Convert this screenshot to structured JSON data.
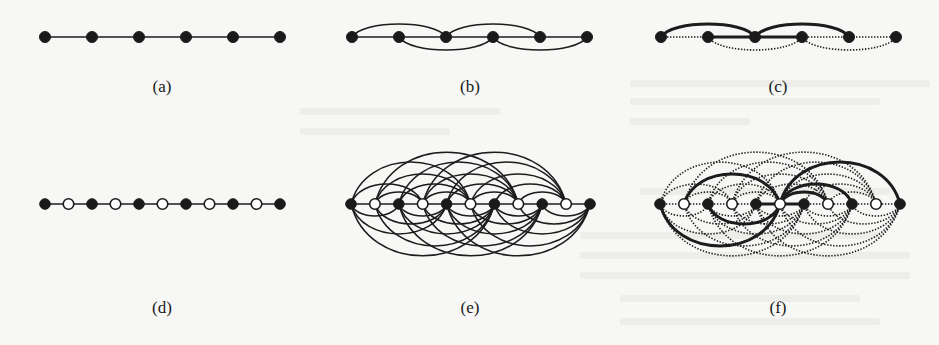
{
  "figure": {
    "panels": [
      {
        "id": "a",
        "label": "(a)",
        "label_x": 162,
        "label_y": 92,
        "y": 37,
        "nodes_x": [
          45,
          92,
          139,
          186,
          233,
          280
        ],
        "node_types": [
          "filled",
          "filled",
          "filled",
          "filled",
          "filled",
          "filled"
        ],
        "edges": [
          {
            "from": 0,
            "to": 5,
            "kind": "line",
            "style": "solid"
          }
        ]
      },
      {
        "id": "b",
        "label": "(b)",
        "label_x": 470,
        "label_y": 92,
        "y": 37,
        "nodes_x": [
          352,
          399,
          446,
          493,
          540,
          587
        ],
        "node_types": [
          "filled",
          "filled",
          "filled",
          "filled",
          "filled",
          "filled"
        ],
        "edges": [
          {
            "from": 0,
            "to": 5,
            "kind": "line",
            "style": "solid"
          },
          {
            "from": 0,
            "to": 2,
            "kind": "arc",
            "h": -13,
            "style": "solid"
          },
          {
            "from": 2,
            "to": 4,
            "kind": "arc",
            "h": -13,
            "style": "solid"
          },
          {
            "from": 1,
            "to": 3,
            "kind": "arc",
            "h": 13,
            "style": "solid"
          },
          {
            "from": 3,
            "to": 5,
            "kind": "arc",
            "h": 13,
            "style": "solid"
          }
        ]
      },
      {
        "id": "c",
        "label": "(c)",
        "label_x": 778,
        "label_y": 92,
        "y": 37,
        "nodes_x": [
          661,
          708,
          755,
          802,
          849,
          896
        ],
        "node_types": [
          "filled",
          "filled",
          "filled",
          "filled",
          "filled",
          "filled"
        ],
        "edges": [
          {
            "from": 0,
            "to": 1,
            "kind": "line",
            "style": "dotted"
          },
          {
            "from": 3,
            "to": 5,
            "kind": "line",
            "style": "dotted"
          },
          {
            "from": 1,
            "to": 3,
            "kind": "arc",
            "h": 13,
            "style": "dotted"
          },
          {
            "from": 3,
            "to": 5,
            "kind": "arc",
            "h": 13,
            "style": "dotted"
          },
          {
            "from": 1,
            "to": 3,
            "kind": "line",
            "style": "thick"
          },
          {
            "from": 0,
            "to": 2,
            "kind": "arc",
            "h": -13,
            "style": "thick"
          },
          {
            "from": 2,
            "to": 4,
            "kind": "arc",
            "h": -13,
            "style": "thick"
          }
        ]
      },
      {
        "id": "d",
        "label": "(d)",
        "label_x": 162,
        "label_y": 313,
        "y": 204,
        "nodes_x": [
          45,
          92,
          139,
          186,
          233,
          280
        ],
        "subdivided": true,
        "edges": [
          {
            "from": 0,
            "to": 10,
            "kind": "line",
            "style": "solid"
          }
        ]
      },
      {
        "id": "e",
        "label": "(e)",
        "label_x": 470,
        "label_y": 313,
        "y": 204,
        "nodes_x": [
          351,
          590
        ],
        "subdivided": true,
        "complete_arcs": {
          "style": "solid",
          "max_span": 6
        }
      },
      {
        "id": "f",
        "label": "(f)",
        "label_x": 778,
        "label_y": 313,
        "y": 204,
        "nodes_x": [
          660,
          900
        ],
        "subdivided": true,
        "complete_arcs": {
          "style": "dotted",
          "max_span": 6
        },
        "thick_edges": [
          {
            "from": 4,
            "to": 6,
            "kind": "line"
          },
          {
            "from": 0,
            "to": 5,
            "kind": "arc",
            "side": "below"
          },
          {
            "from": 1,
            "to": 5,
            "kind": "arc",
            "side": "above"
          },
          {
            "from": 2,
            "to": 5,
            "kind": "arc",
            "side": "below"
          },
          {
            "from": 5,
            "to": 10,
            "kind": "arc",
            "side": "above"
          },
          {
            "from": 5,
            "to": 8,
            "kind": "arc",
            "side": "above"
          },
          {
            "from": 5,
            "to": 7,
            "kind": "arc",
            "side": "above"
          }
        ]
      }
    ],
    "colors": {
      "ink": "#1c1c1c",
      "node_fill": "#1a1a1a",
      "hollow_fill": "#ffffff",
      "paper": "#f7f7f5",
      "bleed": "#d9d9d6"
    }
  }
}
